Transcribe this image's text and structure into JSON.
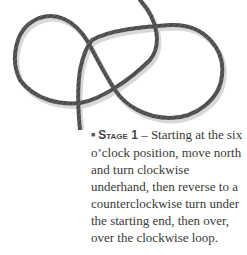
{
  "figure": {
    "rope_color": "#4a4a4a",
    "shadow_color": "#cfcfcf"
  },
  "caption": {
    "bullet": "■",
    "stage_label": "Stage 1",
    "dash": " – ",
    "text": "Starting at the six o’clock position, move north and turn clockwise underhand, then reverse to a counterclockwise turn under the starting end, then over, over the clockwise loop."
  }
}
